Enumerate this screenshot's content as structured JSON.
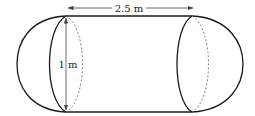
{
  "diagram": {
    "type": "capsule-solid",
    "labels": {
      "length": "2.5 m",
      "diameter": "1 m"
    },
    "colors": {
      "stroke": "#1a1a1a",
      "dashed": "#777777",
      "dimension": "#444444",
      "background": "#ffffff"
    }
  }
}
